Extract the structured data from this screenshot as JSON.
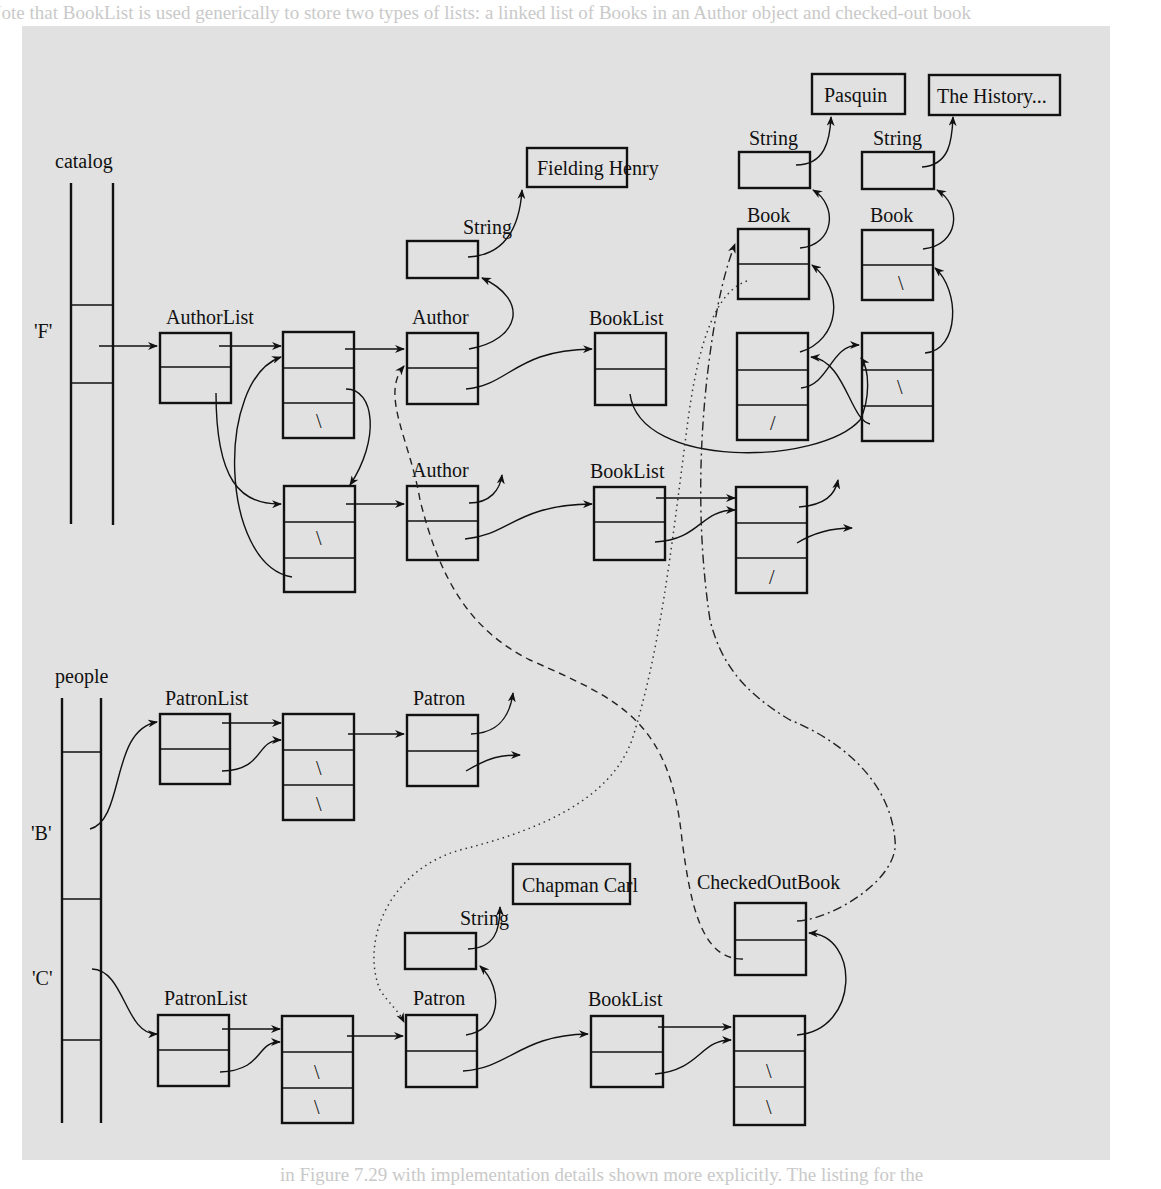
{
  "background_text": {
    "top_line": "perform the same task. Note that BookList is used generically to store two types of lists: a linked list of Books in an Author object and checked-out books in a Patron",
    "bottom_line": "in Figure 7.29 with implementation details shown more explicitly. The listing for the"
  },
  "diagram": {
    "arrays": {
      "catalog": {
        "label": "catalog",
        "slot_labels": [
          "'F'"
        ]
      },
      "people": {
        "label": "people",
        "slot_labels": [
          "'B'",
          "'C'"
        ]
      }
    },
    "class_labels": {
      "author_list": "AuthorList",
      "author_1": "Author",
      "author_2": "Author",
      "book_list_1": "BookList",
      "book_list_2": "BookList",
      "book_list_3": "BookList",
      "string_author": "String",
      "string_book_1": "String",
      "string_book_2": "String",
      "string_patron": "String",
      "book_1": "Book",
      "book_2": "Book",
      "patron_list_1": "PatronList",
      "patron_list_2": "PatronList",
      "patron_1": "Patron",
      "patron_2": "Patron",
      "checked_out_book": "CheckedOutBook"
    },
    "string_values": {
      "fielding": "Fielding Henry",
      "pasquin": "Pasquin",
      "history": "The History...",
      "chapman": "Chapman Carl"
    },
    "null_marker_back": "\\",
    "null_marker_fwd": "/",
    "line_styles": {
      "solid": "reference",
      "dashed": "book → author",
      "dotted": "book → patron",
      "dash_dot": "checked-out book ↔ book"
    }
  }
}
